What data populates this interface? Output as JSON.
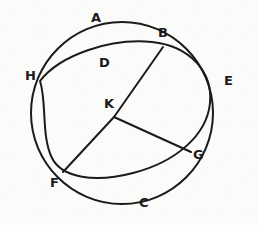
{
  "figure": {
    "kind": "geometry-diagram",
    "ink_color": "#1b1b1b",
    "paper_color": "#fbfbfa",
    "stroke_width": 2,
    "labels": [
      {
        "id": "A",
        "text": "A",
        "x": 91,
        "y": 11
      },
      {
        "id": "B",
        "text": "B",
        "x": 158,
        "y": 26
      },
      {
        "id": "D",
        "text": "D",
        "x": 99,
        "y": 56
      },
      {
        "id": "E",
        "text": "E",
        "x": 224,
        "y": 74
      },
      {
        "id": "H",
        "text": "H",
        "x": 25,
        "y": 69
      },
      {
        "id": "K",
        "text": "K",
        "x": 104,
        "y": 97
      },
      {
        "id": "G",
        "text": "G",
        "x": 193,
        "y": 148
      },
      {
        "id": "F",
        "text": "F",
        "x": 50,
        "y": 176
      },
      {
        "id": "C",
        "text": "C",
        "x": 139,
        "y": 196
      }
    ],
    "points": [
      {
        "id": "B",
        "x": 163,
        "y": 47
      },
      {
        "id": "H",
        "x": 40,
        "y": 81
      },
      {
        "id": "K",
        "x": 114,
        "y": 117
      },
      {
        "id": "G",
        "x": 191,
        "y": 152
      },
      {
        "id": "F",
        "x": 63,
        "y": 172
      }
    ],
    "circle_main": {
      "cx": 122,
      "cy": 113,
      "r": 91
    },
    "ellipse_tilted": {
      "cx": 119,
      "cy": 111,
      "rx": 92,
      "ry": 70,
      "rotation": 24
    },
    "segments": [
      {
        "id": "BKF",
        "from": "B",
        "to": "F",
        "via": "K"
      },
      {
        "id": "KG",
        "from": "K",
        "to": "G"
      }
    ]
  }
}
